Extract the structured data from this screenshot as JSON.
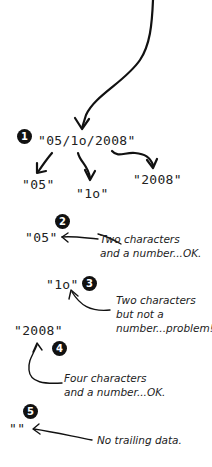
{
  "diagram": {
    "source": {
      "badge": "1",
      "text": "\"05/1o/2008\""
    },
    "split_parts": [
      {
        "text": "\"05\""
      },
      {
        "text": "\"1o\""
      },
      {
        "text": "\"2008\""
      }
    ],
    "checks": [
      {
        "badge": "2",
        "token": "\"05\"",
        "note_lines": [
          "Two characters",
          "and a number...OK."
        ]
      },
      {
        "badge": "3",
        "token": "\"1o\"",
        "note_lines": [
          "Two characters",
          "but not a",
          "number...problem!"
        ]
      },
      {
        "badge": "4",
        "token": "\"2008\"",
        "note_lines": [
          "Four characters",
          "and a number...OK."
        ]
      },
      {
        "badge": "5",
        "token": "\"\"",
        "note_lines": [
          "No trailing data."
        ]
      }
    ]
  }
}
